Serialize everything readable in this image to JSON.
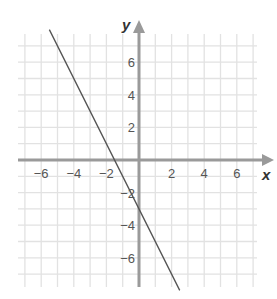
{
  "chart_data": {
    "type": "line",
    "title": "",
    "xlabel": "x",
    "ylabel": "y",
    "xlim": [
      -7,
      7
    ],
    "ylim": [
      -7.5,
      7.5
    ],
    "grid": true,
    "x_ticks": [
      -6,
      -4,
      -2,
      2,
      4,
      6
    ],
    "y_ticks": [
      6,
      4,
      2,
      -2,
      -4,
      -6
    ],
    "x_tick_labels": [
      "−6",
      "−4",
      "−2",
      "2",
      "4",
      "6"
    ],
    "y_tick_labels": [
      "6",
      "4",
      "2",
      "−2",
      "−4",
      "−6"
    ],
    "series": [
      {
        "name": "line",
        "equation": "y = -2x - 3",
        "x": [
          -5.5,
          2.5
        ],
        "y": [
          8,
          -8
        ],
        "color": "#555555"
      }
    ],
    "colors": {
      "grid": "#e2e2e2",
      "axis": "#9a9a9a",
      "line": "#555555"
    }
  }
}
